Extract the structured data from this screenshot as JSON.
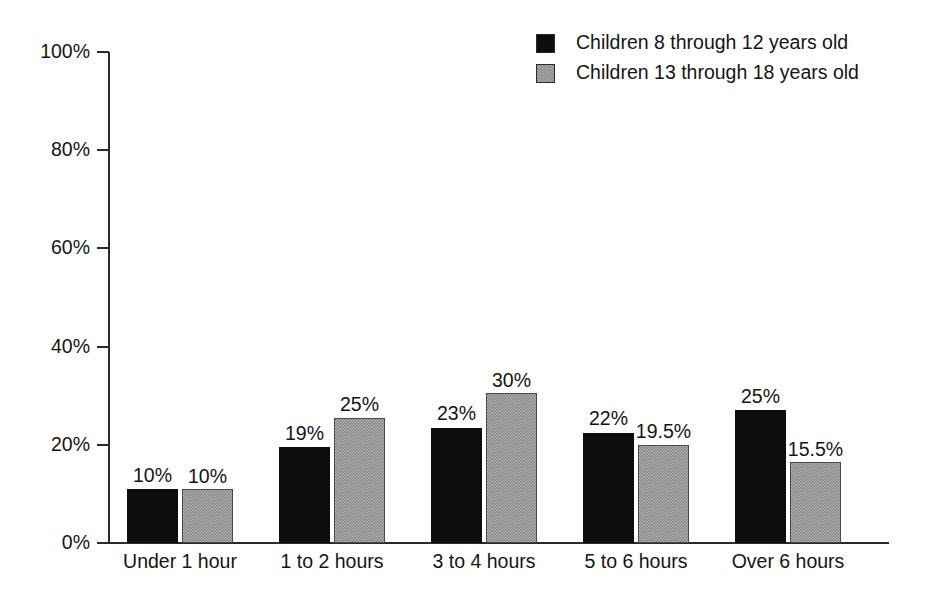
{
  "chart_data": {
    "type": "bar",
    "title": "",
    "subtitle": "",
    "xlabel": "",
    "ylabel": "",
    "ylim": [
      0,
      100
    ],
    "yticks": [
      "0%",
      "20%",
      "40%",
      "60%",
      "80%",
      "100%"
    ],
    "ytick_values": [
      0,
      20,
      40,
      60,
      80,
      100
    ],
    "grid": false,
    "legend_position": "top-right",
    "categories": [
      "Under 1 hour",
      "1 to 2 hours",
      "3 to 4 hours",
      "5 to 6 hours",
      "Over 6 hours"
    ],
    "series": [
      {
        "name": "Children 8 through 12 years old",
        "color": "#0d0d0d",
        "values": [
          10,
          19,
          23,
          22,
          25
        ],
        "labels": [
          "10%",
          "19%",
          "23%",
          "22%",
          "25%"
        ],
        "drawn_heights": [
          11,
          19.5,
          23.5,
          22.5,
          27
        ]
      },
      {
        "name": "Children 13 through 18 years old",
        "color": "#8a8a8a",
        "values": [
          10,
          25,
          30,
          19.5,
          15.5
        ],
        "labels": [
          "10%",
          "25%",
          "30%",
          "19.5%",
          "15.5%"
        ],
        "drawn_heights": [
          11,
          25.5,
          30.5,
          20,
          16.5
        ]
      }
    ]
  },
  "legend": {
    "items": [
      {
        "label": "Children 8 through 12 years old",
        "swatch": "black-square-swatch"
      },
      {
        "label": "Children 13 through 18 years old",
        "swatch": "gray-square-swatch"
      }
    ]
  },
  "axes": {
    "y_tick_labels": [
      "100%",
      "80%",
      "60%",
      "40%",
      "20%",
      "0%"
    ],
    "x_tick_labels": [
      "Under 1 hour",
      "1 to 2 hours",
      "3 to 4 hours",
      "5 to 6 hours",
      "Over 6 hours"
    ]
  },
  "colors": {
    "series_a": "#0d0d0d",
    "series_b": "#8a8a8a",
    "axis": "#2b2b2b",
    "text": "#141414",
    "background": "#ffffff"
  }
}
